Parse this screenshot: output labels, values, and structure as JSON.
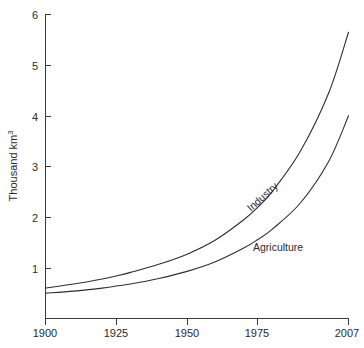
{
  "chart_data": {
    "type": "line",
    "title": "",
    "subtitle": "",
    "xlabel": "",
    "ylabel": "Thousand km",
    "ylabel_superscript": "3",
    "xlim": [
      1900,
      2007
    ],
    "ylim": [
      0,
      6
    ],
    "grid": false,
    "legend_position": "inline-labels",
    "x_ticks": [
      1900,
      1925,
      1950,
      1975,
      2007
    ],
    "x_tick_labels": [
      "1900",
      "1925",
      "1950",
      "1975",
      "2007"
    ],
    "y_ticks": [
      1,
      2,
      3,
      4,
      5,
      6
    ],
    "y_tick_labels": [
      "1",
      "2",
      "3",
      "4",
      "5",
      "6"
    ],
    "x": [
      1900,
      1910,
      1920,
      1925,
      1930,
      1940,
      1950,
      1960,
      1970,
      1975,
      1980,
      1990,
      2000,
      2007
    ],
    "series": [
      {
        "name": "Industry",
        "label": "Industry",
        "color": "#2e2e2e",
        "values": [
          0.6,
          0.68,
          0.78,
          0.84,
          0.91,
          1.07,
          1.27,
          1.55,
          1.95,
          2.2,
          2.5,
          3.3,
          4.45,
          5.65
        ]
      },
      {
        "name": "Agriculture",
        "label": "Agriculture",
        "color": "#2e2e2e",
        "values": [
          0.5,
          0.54,
          0.6,
          0.64,
          0.68,
          0.79,
          0.93,
          1.12,
          1.39,
          1.56,
          1.76,
          2.28,
          3.1,
          4.0
        ]
      }
    ],
    "annotations": [
      {
        "text": "Industry",
        "rotation_deg": -42,
        "near_series": "Industry"
      },
      {
        "text": "Agriculture",
        "rotation_deg": 0,
        "near_series": "Agriculture"
      }
    ]
  }
}
